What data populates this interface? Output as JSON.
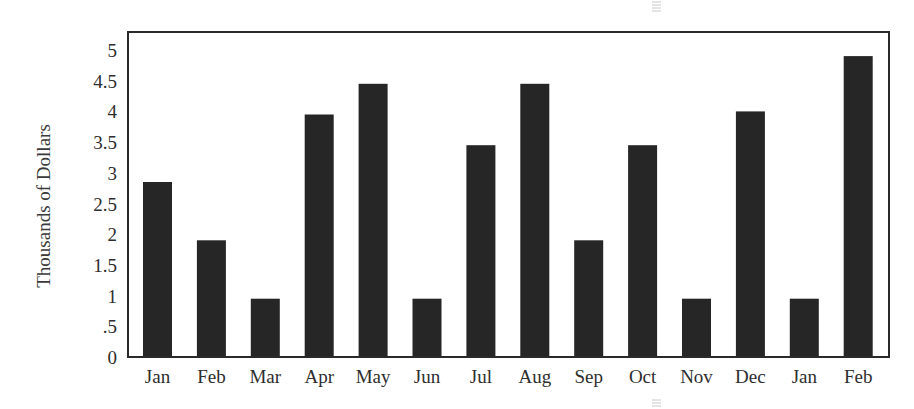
{
  "chart_data": {
    "type": "bar",
    "title": "",
    "xlabel": "",
    "ylabel": "Thousands of Dollars",
    "categories": [
      "Jan",
      "Feb",
      "Mar",
      "Apr",
      "May",
      "Jun",
      "Jul",
      "Aug",
      "Sep",
      "Oct",
      "Nov",
      "Dec",
      "Jan",
      "Feb"
    ],
    "values": [
      2.85,
      1.9,
      0.95,
      3.95,
      4.45,
      0.95,
      3.45,
      4.45,
      1.9,
      3.45,
      0.95,
      4.0,
      0.95,
      4.9
    ],
    "ylim": [
      0,
      5
    ],
    "yticks": [
      0,
      0.5,
      1,
      1.5,
      2,
      2.5,
      3,
      3.5,
      4,
      4.5,
      5
    ],
    "ytick_labels": [
      "0",
      ".5",
      "1",
      "1.5",
      "2",
      "2.5",
      "3",
      "3.5",
      "4",
      "4.5",
      "5"
    ],
    "grid": false,
    "legend": null,
    "bar_color": "#262626"
  }
}
